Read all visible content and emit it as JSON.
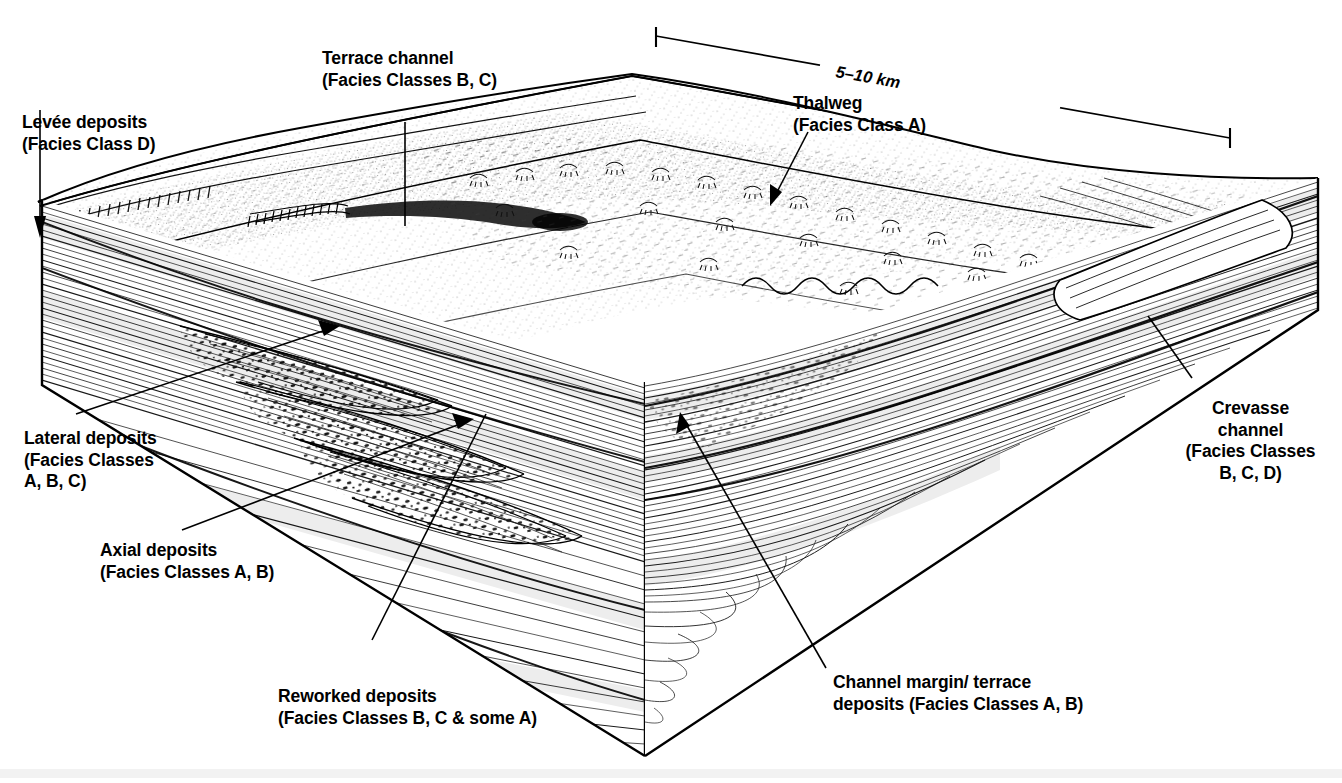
{
  "figure": {
    "type": "block-diagram",
    "scale_bar": {
      "label": "5–10 km"
    },
    "labels": [
      {
        "id": "terrace-channel",
        "lines": [
          "Terrace channel",
          "(Facies Classes B, C)"
        ]
      },
      {
        "id": "levee-deposits",
        "lines": [
          "Levée deposits",
          "(Facies Class D)"
        ]
      },
      {
        "id": "thalweg",
        "lines": [
          "Thalweg",
          "(Facies Class A)"
        ]
      },
      {
        "id": "crevasse-channel",
        "lines": [
          "Crevasse",
          "channel",
          "(Facies Classes",
          "B, C, D)"
        ]
      },
      {
        "id": "lateral-deposits",
        "lines": [
          "Lateral deposits",
          "(Facies Classes",
          "A, B, C)"
        ]
      },
      {
        "id": "axial-deposits",
        "lines": [
          "Axial deposits",
          "(Facies Classes A, B)"
        ]
      },
      {
        "id": "reworked-deposits",
        "lines": [
          "Reworked deposits",
          "(Facies Classes B, C & some A)"
        ]
      },
      {
        "id": "channel-margin",
        "lines": [
          "Channel margin/ terrace",
          "deposits (Facies Classes A, B)"
        ]
      }
    ],
    "label_text": {
      "terrace_channel_1": "Terrace channel",
      "terrace_channel_2": "(Facies Classes B, C)",
      "levee_1": "Levée deposits",
      "levee_2": "(Facies Class D)",
      "thalweg_1": "Thalweg",
      "thalweg_2": "(Facies Class A)",
      "crevasse_1": "Crevasse",
      "crevasse_2": "channel",
      "crevasse_3": "(Facies Classes",
      "crevasse_4": "B, C, D)",
      "lateral_1": "Lateral deposits",
      "lateral_2": "(Facies Classes",
      "lateral_3": "A, B, C)",
      "axial_1": "Axial deposits",
      "axial_2": "(Facies Classes A, B)",
      "reworked_1": "Reworked deposits",
      "reworked_2": "(Facies Classes B, C & some A)",
      "margin_1": "Channel margin/ terrace",
      "margin_2": "deposits (Facies Classes A, B)",
      "scale": "5–10 km"
    },
    "colors": {
      "ink": "#000000",
      "paper": "#ffffff",
      "tint": "#f0f0f0"
    }
  }
}
